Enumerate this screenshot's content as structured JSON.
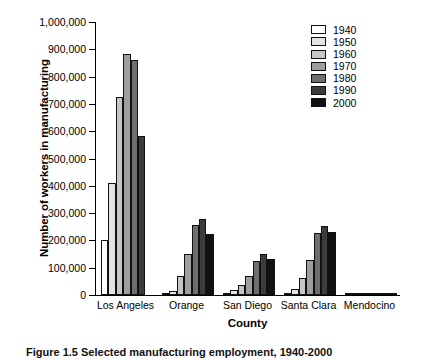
{
  "chart_data": {
    "type": "bar",
    "title": "",
    "xlabel": "County",
    "ylabel": "Number of workers in manufacturing",
    "ylim": [
      0,
      1000000
    ],
    "ytick_values": [
      0,
      100000,
      200000,
      300000,
      400000,
      500000,
      600000,
      700000,
      800000,
      900000,
      1000000
    ],
    "ytick_labels": [
      "0",
      "100,000",
      "200,000",
      "300,000",
      "400,000",
      "500,000",
      "600,000",
      "700,000",
      "800,000",
      "900,000",
      "1,000,000"
    ],
    "grid": false,
    "legend_position": "top-right",
    "categories": [
      "Los Angeles",
      "Orange",
      "San Diego",
      "Santa Clara",
      "Mendocino"
    ],
    "series": [
      {
        "name": "1940",
        "color": "#ffffff",
        "values": [
          203000,
          5000,
          7000,
          6000,
          3000
        ]
      },
      {
        "name": "1950",
        "color": "#e3e3e3",
        "values": [
          409000,
          14000,
          17000,
          22000,
          5000
        ]
      },
      {
        "name": "1960",
        "color": "#c6c6c6",
        "values": [
          726000,
          68000,
          38000,
          62000,
          6000
        ]
      },
      {
        "name": "1970",
        "color": "#9e9e9e",
        "values": [
          884000,
          152000,
          70000,
          128000,
          7000
        ]
      },
      {
        "name": "1980",
        "color": "#6e6e6e",
        "values": [
          860000,
          255000,
          123000,
          228000,
          8000
        ]
      },
      {
        "name": "1990",
        "color": "#3c3c3c",
        "values": [
          583000,
          280000,
          152000,
          253000,
          9000
        ]
      },
      {
        "name": "2000",
        "color": "#111111",
        "values": [
          null,
          224000,
          131000,
          231000,
          7000
        ]
      }
    ]
  },
  "legend": {
    "items": [
      {
        "label": "1940",
        "color": "#ffffff"
      },
      {
        "label": "1950",
        "color": "#e3e3e3"
      },
      {
        "label": "1960",
        "color": "#c6c6c6"
      },
      {
        "label": "1970",
        "color": "#9e9e9e"
      },
      {
        "label": "1980",
        "color": "#6e6e6e"
      },
      {
        "label": "1990",
        "color": "#3c3c3c"
      },
      {
        "label": "2000",
        "color": "#111111"
      }
    ]
  },
  "caption": {
    "text": "Figure 1.5   Selected manufacturing employment, 1940-2000"
  }
}
